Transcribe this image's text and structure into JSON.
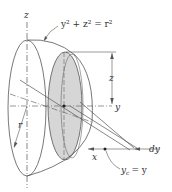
{
  "diagram": {
    "labels": {
      "z_axis": "z",
      "equation": "y² + z² = r²",
      "dim_z": "z",
      "dim_y": "y",
      "radius": "r",
      "x_axis": "x",
      "dy": "dy",
      "yc": "y",
      "yc_sub": "c",
      "yc_eq": "= y"
    },
    "colors": {
      "line": "#555555",
      "shade": "#d4d4d4",
      "text": "#333333"
    }
  }
}
